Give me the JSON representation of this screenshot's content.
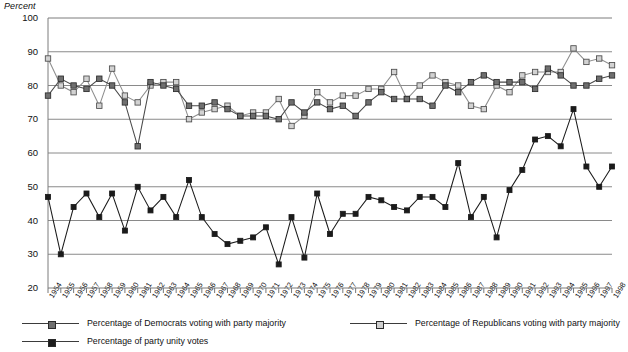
{
  "axis": {
    "unit_label": "Percent",
    "y_ticks": [
      100,
      90,
      80,
      70,
      60,
      50,
      40,
      30,
      20
    ],
    "y_min": 20,
    "y_max": 100
  },
  "legend": {
    "items": [
      {
        "key": "democrats",
        "label": "Percentage of Democrats voting with party majority",
        "marker": "dem-marker",
        "color": "#6f6f6f"
      },
      {
        "key": "republicans",
        "label": "Percentage of Republicans voting with party majority",
        "marker": "rep-marker",
        "color": "#cfcfcf"
      },
      {
        "key": "unity",
        "label": "Percentage of party unity votes",
        "marker": "unity-marker",
        "color": "#1d1d1d"
      }
    ]
  },
  "chart_data": {
    "type": "line",
    "title": "",
    "xlabel": "",
    "ylabel": "Percent",
    "ylim": [
      20,
      100
    ],
    "grid": true,
    "legend_position": "bottom",
    "x": [
      1954,
      1955,
      1956,
      1957,
      1958,
      1959,
      1960,
      1961,
      1962,
      1963,
      1964,
      1965,
      1966,
      1967,
      1968,
      1969,
      1970,
      1971,
      1972,
      1973,
      1974,
      1975,
      1976,
      1977,
      1978,
      1979,
      1980,
      1981,
      1982,
      1983,
      1984,
      1985,
      1986,
      1987,
      1988,
      1989,
      1990,
      1991,
      1992,
      1993,
      1994,
      1995,
      1996,
      1997,
      1998
    ],
    "categories": [
      "1954",
      "1955",
      "1956",
      "1957",
      "1958",
      "1959",
      "1960",
      "1961",
      "1962",
      "1963",
      "1964",
      "1965",
      "1966",
      "1967",
      "1968",
      "1969",
      "1970",
      "1971",
      "1972",
      "1973",
      "1974",
      "1975",
      "1976",
      "1977",
      "1978",
      "1979",
      "1980",
      "1981",
      "1982",
      "1983",
      "1984",
      "1985",
      "1986",
      "1987",
      "1988",
      "1989",
      "1990",
      "1991",
      "1992",
      "1993",
      "1994",
      "1995",
      "1996",
      "1997",
      "1998"
    ],
    "series": [
      {
        "name": "Percentage of Democrats voting with party majority",
        "key": "democrats",
        "color": "#6f6f6f",
        "values": [
          77,
          82,
          80,
          79,
          82,
          80,
          75,
          62,
          81,
          80,
          79,
          74,
          74,
          75,
          73,
          71,
          71,
          71,
          70,
          75,
          72,
          75,
          73,
          74,
          71,
          75,
          78,
          76,
          76,
          76,
          74,
          80,
          78,
          81,
          83,
          81,
          81,
          81,
          79,
          85,
          83,
          80,
          80,
          82,
          83
        ]
      },
      {
        "name": "Percentage of Republicans voting with party majority",
        "key": "republicans",
        "color": "#cfcfcf",
        "values": [
          88,
          80,
          78,
          82,
          74,
          85,
          77,
          75,
          80,
          81,
          81,
          70,
          72,
          73,
          74,
          71,
          72,
          72,
          76,
          68,
          71,
          78,
          75,
          77,
          77,
          79,
          79,
          84,
          76,
          80,
          83,
          81,
          80,
          74,
          73,
          80,
          78,
          83,
          84,
          84,
          84,
          91,
          87,
          88,
          86
        ]
      },
      {
        "name": "Percentage of party unity votes",
        "key": "unity",
        "color": "#1d1d1d",
        "values": [
          47,
          30,
          44,
          48,
          41,
          48,
          37,
          50,
          43,
          47,
          41,
          52,
          41,
          36,
          33,
          34,
          35,
          38,
          27,
          41,
          29,
          48,
          36,
          42,
          42,
          47,
          46,
          44,
          43,
          47,
          47,
          44,
          57,
          41,
          47,
          35,
          49,
          55,
          64,
          65,
          62,
          73,
          56,
          50,
          56
        ]
      }
    ]
  }
}
